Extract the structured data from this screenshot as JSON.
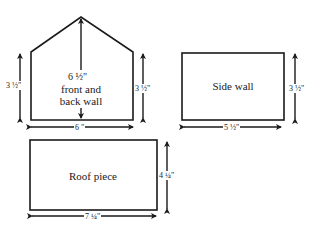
{
  "diagram": {
    "pieces": [
      {
        "name": "front and back wall",
        "label": "front and\nback wall",
        "label_line1": "front and",
        "label_line2": "back wall",
        "shape": "pentagon",
        "dimensions": {
          "left_height": "3 ½\"",
          "right_height": "3 ½\"",
          "peak_height": "6 ½\"",
          "width": "6 \""
        }
      },
      {
        "name": "side wall",
        "label": "Side wall",
        "shape": "rectangle",
        "dimensions": {
          "height": "3 ½\"",
          "width": "5 ½\""
        }
      },
      {
        "name": "roof piece",
        "label": "Roof piece",
        "shape": "rectangle",
        "dimensions": {
          "height": "4 ¼\"",
          "width": "7 ¼\""
        }
      }
    ],
    "colors": {
      "line": "#1a1a1a",
      "background": "#ffffff"
    }
  }
}
